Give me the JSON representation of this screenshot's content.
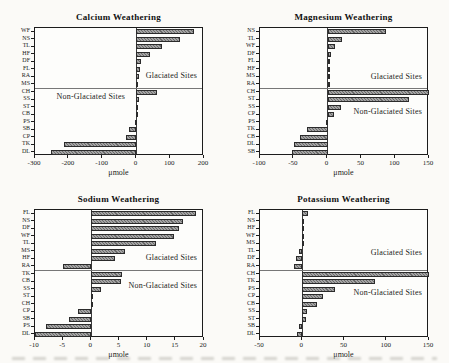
{
  "figure": {
    "type": "scanned-journal-figure",
    "panels": [
      "Calcium Weathering",
      "Magnesium Weathering",
      "Sodium Weathering",
      "Potassium Weathering"
    ]
  },
  "colors": {
    "page_bg": "#fbfaf7",
    "plot_bg": "#fdfdfb",
    "bar_fill": "#979797",
    "bar_border": "#2b2b2b",
    "frame": "#1c1c1c",
    "divider": "#777777",
    "text": "#111111"
  },
  "chart_data": [
    {
      "type": "bar",
      "orientation": "horizontal",
      "title": "Calcium Weathering",
      "xlabel": "μmole",
      "xlim": [
        -300,
        200
      ],
      "xticks": [
        -300,
        -200,
        -100,
        0,
        100,
        200
      ],
      "grid": false,
      "groups": [
        {
          "label": "Glaciated Sites",
          "label_align": "right",
          "label_x_frac": 0.97,
          "label_v_frac": 0.78,
          "sites": [
            "WF",
            "NS",
            "TL",
            "HF",
            "DF",
            "FL",
            "RA",
            "MS"
          ],
          "values": [
            170,
            130,
            76,
            40,
            14,
            10,
            8,
            6
          ]
        },
        {
          "label": "Non-Glaciated Sites",
          "label_align": "center",
          "label_x_frac": 0.33,
          "label_v_frac": 0.12,
          "sites": [
            "CH",
            "SS",
            "ST",
            "CB",
            "PS",
            "SB",
            "CP",
            "TK",
            "DL"
          ],
          "values": [
            60,
            8,
            5,
            3,
            -4,
            -22,
            -30,
            -215,
            -252
          ]
        }
      ]
    },
    {
      "type": "bar",
      "orientation": "horizontal",
      "title": "Magnesium Weathering",
      "xlabel": "μmole",
      "xlim": [
        -100,
        150
      ],
      "xticks": [
        -100,
        -50,
        0,
        50,
        100,
        150
      ],
      "grid": false,
      "groups": [
        {
          "label": "Glaciated Sites",
          "label_align": "right",
          "label_x_frac": 0.97,
          "label_v_frac": 0.8,
          "sites": [
            "NS",
            "TL",
            "WF",
            "DF",
            "FL",
            "HF",
            "MS",
            "RA"
          ],
          "values": [
            87,
            22,
            11,
            5,
            4,
            4,
            3,
            2
          ]
        },
        {
          "label": "Non-Glaciated Sites",
          "label_align": "right",
          "label_x_frac": 0.97,
          "label_v_frac": 0.33,
          "sites": [
            "CH",
            "ST",
            "SS",
            "CP",
            "PS",
            "TK",
            "CB",
            "DL",
            "SB"
          ],
          "values": [
            150,
            121,
            20,
            9,
            -2,
            -30,
            -41,
            -49,
            -52
          ]
        }
      ]
    },
    {
      "type": "bar",
      "orientation": "horizontal",
      "title": "Sodium Weathering",
      "xlabel": "μmole",
      "xlim": [
        -10,
        20
      ],
      "xticks": [
        -10,
        -5,
        0,
        5,
        10,
        15,
        20
      ],
      "grid": false,
      "groups": [
        {
          "label": "Glaciated Sites",
          "label_align": "right",
          "label_x_frac": 0.97,
          "label_v_frac": 0.78,
          "sites": [
            "FL",
            "NS",
            "DF",
            "WF",
            "TL",
            "MS",
            "HF",
            "RA"
          ],
          "values": [
            18.5,
            16.2,
            15.5,
            14.6,
            11.4,
            5.9,
            4.2,
            -5
          ]
        },
        {
          "label": "Non-Glaciated Sites",
          "label_align": "right",
          "label_x_frac": 0.97,
          "label_v_frac": 0.22,
          "sites": [
            "TK",
            "CB",
            "SS",
            "ST",
            "CH",
            "CP",
            "SB",
            "PS",
            "DL"
          ],
          "values": [
            5.5,
            5.2,
            1.8,
            0.3,
            0.2,
            -2.3,
            -3.9,
            -8,
            -10
          ]
        }
      ]
    },
    {
      "type": "bar",
      "orientation": "horizontal",
      "title": "Potassium Weathering",
      "xlabel": "μmole",
      "xlim": [
        -50,
        150
      ],
      "xticks": [
        -50,
        0,
        50,
        100,
        150
      ],
      "grid": false,
      "groups": [
        {
          "label": "Glaciated Sites",
          "label_align": "right",
          "label_x_frac": 0.97,
          "label_v_frac": 0.7,
          "sites": [
            "FL",
            "NS",
            "HF",
            "WF",
            "MS",
            "TL",
            "DF",
            "RA"
          ],
          "values": [
            6.5,
            1.5,
            1.2,
            0.8,
            0.6,
            -3.5,
            -7,
            -10
          ]
        },
        {
          "label": "Non-Glaciated Sites",
          "label_align": "right",
          "label_x_frac": 0.97,
          "label_v_frac": 0.32,
          "sites": [
            "CH",
            "TK",
            "PS",
            "CP",
            "CB",
            "SS",
            "ST",
            "SB",
            "DL"
          ],
          "values": [
            150,
            86,
            39,
            24,
            17,
            6,
            5,
            -4,
            -6
          ]
        }
      ]
    }
  ]
}
